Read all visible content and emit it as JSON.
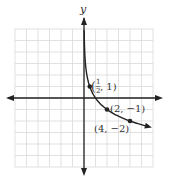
{
  "chart_data": {
    "type": "line",
    "title": "",
    "xlabel": "",
    "ylabel": "y",
    "function": "y = -log2(x)",
    "xlim": [
      -6,
      6
    ],
    "ylim": [
      -6,
      6
    ],
    "grid": true,
    "series": [
      {
        "name": "curve",
        "x": [
          0.125,
          0.25,
          0.5,
          1,
          2,
          4,
          5.5
        ],
        "values": [
          3,
          2,
          1,
          0,
          -1,
          -2,
          -2.46
        ]
      }
    ],
    "points": [
      {
        "x": 0.5,
        "y": 1,
        "label": "(1/2, 1)"
      },
      {
        "x": 2,
        "y": -1,
        "label": "(2, −1)"
      },
      {
        "x": 4,
        "y": -2,
        "label": "(4, −2)"
      }
    ]
  },
  "labels": {
    "y_axis": "y",
    "p1_num": "1",
    "p1_den": "2",
    "p1_rest": ", 1)",
    "p1_open": "(",
    "p2": "(2, −1)",
    "p3": "(4, −2)"
  },
  "colors": {
    "grid": "#d9d9d9",
    "axis": "#222222",
    "curve": "#222222"
  }
}
